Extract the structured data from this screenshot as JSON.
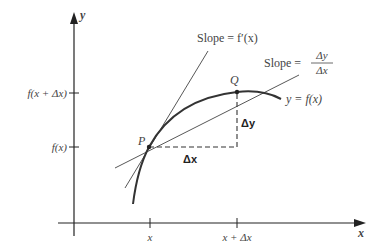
{
  "diagram": {
    "axes": {
      "x_label": "x",
      "y_label": "y"
    },
    "x_ticks": [
      {
        "label": "x",
        "px": 150
      },
      {
        "label": "x + Δx",
        "px": 237
      }
    ],
    "y_ticks": [
      {
        "label": "f(x + Δx)",
        "py": 93
      },
      {
        "label": "f(x)",
        "py": 147
      }
    ],
    "points": {
      "P": {
        "label": "P"
      },
      "Q": {
        "label": "Q"
      }
    },
    "curve_label": "y = f(x)",
    "tangent_label": "Slope = f′(x)",
    "secant_label_prefix": "Slope =",
    "secant_label_num": "Δy",
    "secant_label_den": "Δx",
    "delta_x_label": "Δx",
    "delta_y_label": "Δy",
    "colors": {
      "axis": "#222222",
      "curve": "#333333",
      "lines": "#444444",
      "text": "#444444"
    }
  }
}
